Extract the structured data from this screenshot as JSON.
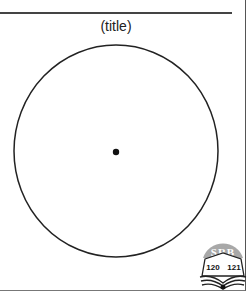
{
  "figure": {
    "title": "(title)",
    "shape": "circle",
    "center_point": "dot"
  },
  "logo": {
    "text": "SRB",
    "left_page": "120",
    "right_page": "121",
    "icon": "open-book-icon"
  },
  "colors": {
    "stroke": "#222222",
    "logo_fill": "#9a9a9a"
  }
}
